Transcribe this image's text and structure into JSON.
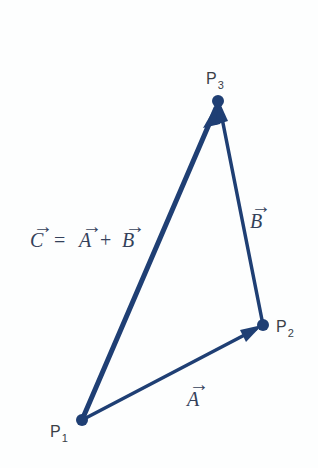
{
  "diagram": {
    "type": "vector-triangle",
    "colors": {
      "vector": "#1f3f74",
      "text": "#3a3f47",
      "background": "#fdfefe"
    },
    "points": [
      {
        "id": "P1",
        "label": "P",
        "sub": "1",
        "x": 82,
        "y": 420
      },
      {
        "id": "P2",
        "label": "P",
        "sub": "2",
        "x": 263,
        "y": 325
      },
      {
        "id": "P3",
        "label": "P",
        "sub": "3",
        "x": 218,
        "y": 101
      }
    ],
    "vectors": [
      {
        "name": "A",
        "from": "P1",
        "to": "P2",
        "label": "A"
      },
      {
        "name": "B",
        "from": "P2",
        "to": "P3",
        "label": "B"
      },
      {
        "name": "C",
        "from": "P1",
        "to": "P3",
        "label": "C"
      }
    ],
    "equation": {
      "lhs": "C",
      "eq": "=",
      "a": "A",
      "plus": "+",
      "b": "B"
    },
    "arrow_glyph": "→"
  }
}
